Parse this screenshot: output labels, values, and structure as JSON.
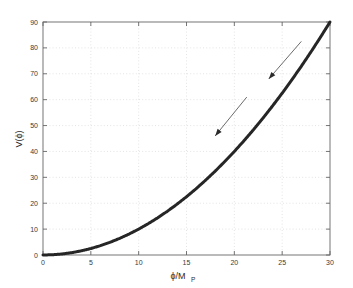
{
  "chart_data": {
    "type": "line",
    "title": "",
    "xlabel": "ϕ/M_P",
    "xlabel_main": "ϕ/M",
    "xlabel_sub": "P",
    "ylabel": "V(ϕ)",
    "xlim": [
      0,
      30
    ],
    "ylim": [
      0,
      90
    ],
    "xticks": [
      0,
      5,
      10,
      15,
      20,
      25,
      30
    ],
    "xtick_labels": [
      "0",
      "5",
      "10",
      "15",
      "20",
      "25",
      "30"
    ],
    "yticks": [
      0,
      10,
      20,
      30,
      40,
      50,
      60,
      70,
      80,
      90
    ],
    "ytick_labels": [
      "0",
      "10",
      "20",
      "30",
      "40",
      "50",
      "60",
      "70",
      "80",
      "90"
    ],
    "grid": true,
    "grid_style": "dotted",
    "legend": null,
    "series": [
      {
        "name": "V(ϕ) = 0.1 ϕ^2",
        "color": "#262626",
        "linewidth": 3,
        "x": [
          0,
          1,
          2,
          3,
          4,
          5,
          6,
          7,
          8,
          9,
          10,
          11,
          12,
          13,
          14,
          15,
          16,
          17,
          18,
          19,
          20,
          21,
          22,
          23,
          24,
          25,
          26,
          27,
          28,
          29,
          30
        ],
        "values": [
          0,
          0.1,
          0.4,
          0.9,
          1.6,
          2.5,
          3.6,
          4.9,
          6.4,
          8.1,
          10.0,
          12.1,
          14.4,
          16.9,
          19.6,
          22.5,
          25.6,
          28.9,
          32.4,
          36.1,
          40.0,
          44.1,
          48.4,
          52.9,
          57.6,
          62.5,
          67.6,
          72.9,
          78.4,
          84.1,
          90.0
        ]
      }
    ],
    "annotations": [
      {
        "name": "arrow-upper",
        "type": "arrow",
        "color": "#5a5a5a",
        "tail": {
          "x": 27.0,
          "y": 82.5
        },
        "head": {
          "x": 23.6,
          "y": 68.0
        }
      },
      {
        "name": "arrow-lower",
        "type": "arrow",
        "color": "#5a5a5a",
        "tail": {
          "x": 21.3,
          "y": 61.0
        },
        "head": {
          "x": 18.0,
          "y": 46.0
        }
      }
    ],
    "colors": {
      "curve": "#262626",
      "arrow": "#5a5a5a",
      "axis": "#666666",
      "grid": "#d8d8d8",
      "background": "#ffffff",
      "tick_text": "#3a3a3a"
    }
  }
}
